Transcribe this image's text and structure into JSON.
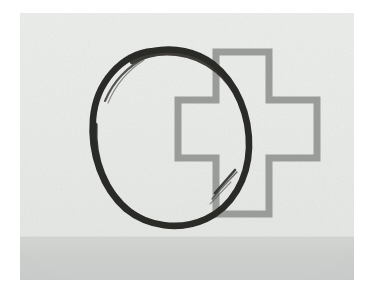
{
  "image": {
    "kind": "photograph-of-drawing",
    "title": "Hand-drawn circle overlapping an outlined cross",
    "frame": {
      "outer_background": "#ffffff",
      "margin_left": 20,
      "margin_top": 13,
      "photo_width": 334,
      "photo_height": 267
    },
    "background": {
      "name": "light-paper-backdrop",
      "top_color": "#eceeec",
      "bottom_color": "#e5e7e5"
    },
    "surface": {
      "name": "gray-surface-band",
      "color": "#cfd1cf",
      "height": 42
    },
    "shapes": [
      {
        "name": "brush-circle",
        "description": "Hand-drawn dark brush-stroke ring (enso style) with a thin secondary arc at upper-left and a short flick stroke at lower-right",
        "color": "#2b2a28",
        "stroke_width": 7,
        "center_x": 148,
        "center_y": 121,
        "radius_x": 76,
        "radius_y": 84
      },
      {
        "name": "outlined-cross",
        "description": "Gray outlined plus / cross symbol drawn with a uniform stroke, overlapping the circle on the right",
        "color": "#9a9c9a",
        "stroke_width": 7,
        "left": 155,
        "top": 36,
        "width": 127,
        "height": 166,
        "arm_thickness": 62
      }
    ],
    "palette": {
      "white": "#ffffff",
      "paper": "#eceeec",
      "surface_gray": "#cfd1cf",
      "cross_gray": "#9a9c9a",
      "ink_black": "#2b2a28"
    }
  }
}
